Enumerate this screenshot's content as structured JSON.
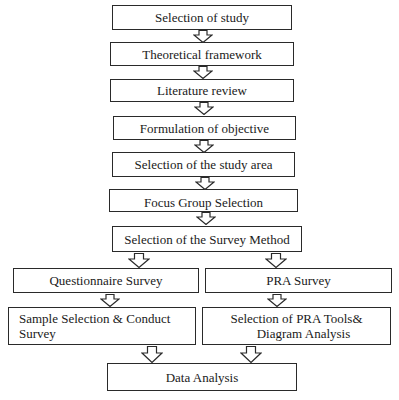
{
  "diagram": {
    "type": "flowchart",
    "steps": [
      {
        "id": "selection-of-study",
        "label": "Selection of study"
      },
      {
        "id": "theoretical-framework",
        "label": "Theoretical framework"
      },
      {
        "id": "literature-review",
        "label": "Literature review"
      },
      {
        "id": "formulation-of-objective",
        "label": "Formulation of objective"
      },
      {
        "id": "selection-of-study-area",
        "label": "Selection of the study area"
      },
      {
        "id": "focus-group-selection",
        "label": "Focus Group Selection"
      },
      {
        "id": "selection-of-survey-method",
        "label": "Selection of the Survey Method"
      },
      {
        "id": "questionnaire-survey",
        "label": "Questionnaire Survey"
      },
      {
        "id": "pra-survey",
        "label": "PRA Survey"
      },
      {
        "id": "sample-selection",
        "label_line1": "Sample Selection & Conduct",
        "label_line2": "Survey"
      },
      {
        "id": "pra-tools",
        "label_line1": "Selection of PRA Tools&",
        "label_line2": "Diagram Analysis"
      },
      {
        "id": "data-analysis",
        "label": "Data Analysis"
      }
    ],
    "edges": [
      [
        "selection-of-study",
        "theoretical-framework"
      ],
      [
        "theoretical-framework",
        "literature-review"
      ],
      [
        "literature-review",
        "formulation-of-objective"
      ],
      [
        "formulation-of-objective",
        "selection-of-study-area"
      ],
      [
        "selection-of-study-area",
        "focus-group-selection"
      ],
      [
        "focus-group-selection",
        "selection-of-survey-method"
      ],
      [
        "selection-of-survey-method",
        "questionnaire-survey"
      ],
      [
        "selection-of-survey-method",
        "pra-survey"
      ],
      [
        "questionnaire-survey",
        "sample-selection"
      ],
      [
        "pra-survey",
        "pra-tools"
      ],
      [
        "sample-selection",
        "data-analysis"
      ],
      [
        "pra-tools",
        "data-analysis"
      ]
    ],
    "arrow_style": "hollow-block-arrow-down",
    "colors": {
      "stroke": "#2a2a2a",
      "fill": "#ffffff",
      "text": "#1a1a1a"
    }
  }
}
